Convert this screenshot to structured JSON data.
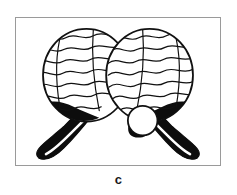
{
  "figure": {
    "caption": "c",
    "frame": {
      "border_color": "#9a9a9a",
      "background_color": "#ffffff",
      "x": 15,
      "y": 17,
      "width": 206,
      "height": 149
    }
  },
  "illustration": {
    "title": "paddle-ball rackets",
    "ink_color": "#0d0d0d",
    "fill_color": "#ffffff",
    "outline_color": "#111111",
    "items": [
      {
        "name": "left-racket",
        "head_label": "left racket head",
        "handle_label": "left racket handle",
        "head_fill": "#ffffff",
        "handle_fill": "#0d0d0d",
        "pattern": "wavy-lines",
        "wave_count": 6
      },
      {
        "name": "right-racket",
        "head_label": "right racket head",
        "handle_label": "right racket handle",
        "head_fill": "#ffffff",
        "handle_fill": "#0d0d0d",
        "pattern": "wavy-lines",
        "wave_count": 6
      },
      {
        "name": "ball",
        "label": "play ball",
        "fill": "#ffffff",
        "shadow_fill": "#0d0d0d",
        "cx": 128,
        "cy": 104,
        "r": 15
      }
    ]
  }
}
